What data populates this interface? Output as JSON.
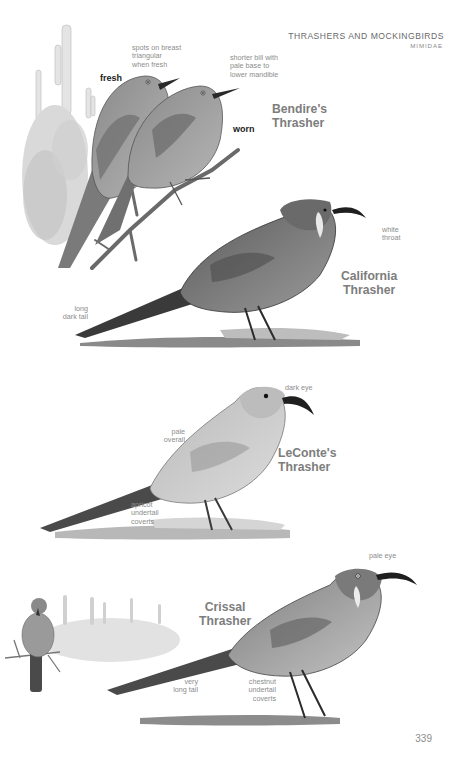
{
  "header": {
    "title": "THRASHERS AND MOCKINGBIRDS",
    "family": "MIMIDAE"
  },
  "plates": [
    {
      "species": "Bendire's\nThrasher",
      "labels": {
        "fresh_tag": "fresh",
        "worn_tag": "worn",
        "note_breast": "spots on breast\ntriangular\nwhen fresh",
        "note_bill": "shorter bill with\npale base to\nlower mandible"
      }
    },
    {
      "species": "California\nThrasher",
      "labels": {
        "note_throat": "white\nthroat",
        "note_tail": "long\ndark tail"
      }
    },
    {
      "species": "LeConte's\nThrasher",
      "labels": {
        "note_eye": "dark eye",
        "note_overall": "pale\noverall",
        "note_coverts": "apricot\nundertail\ncoverts"
      }
    },
    {
      "species": "Crissal\nThrasher",
      "labels": {
        "note_eye": "pale eye",
        "note_tail": "very\nlong tail",
        "note_coverts": "chestnut\nundertail\ncoverts"
      }
    }
  ],
  "page_number": "339",
  "colors": {
    "species_heading": "#7d7d7d",
    "annotation": "#8c8c8c",
    "tag": "#1c1c1c"
  }
}
